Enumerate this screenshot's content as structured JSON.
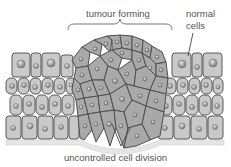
{
  "diagram": {
    "labels": {
      "tumour_forming": "tumour forming",
      "normal_cells_line1": "normal",
      "normal_cells_line2": "cells",
      "uncontrolled_division": "uncontrolled cell division"
    },
    "regions": [
      {
        "name": "normal tissue left",
        "type": "normal-cells"
      },
      {
        "name": "tumour mass",
        "type": "tumour-cells"
      },
      {
        "name": "normal tissue right",
        "type": "normal-cells"
      },
      {
        "name": "basement membrane",
        "type": "membrane"
      }
    ],
    "colors": {
      "normal_cell_fill": "#c9c9c9",
      "tumour_cell_fill": "#a9a9a9",
      "cell_outline": "#5a5a5a",
      "nucleus_fill": "#9a9a9a",
      "membrane": "#e4e4e4",
      "label_text": "#555555",
      "pointer_line": "#666666"
    }
  }
}
